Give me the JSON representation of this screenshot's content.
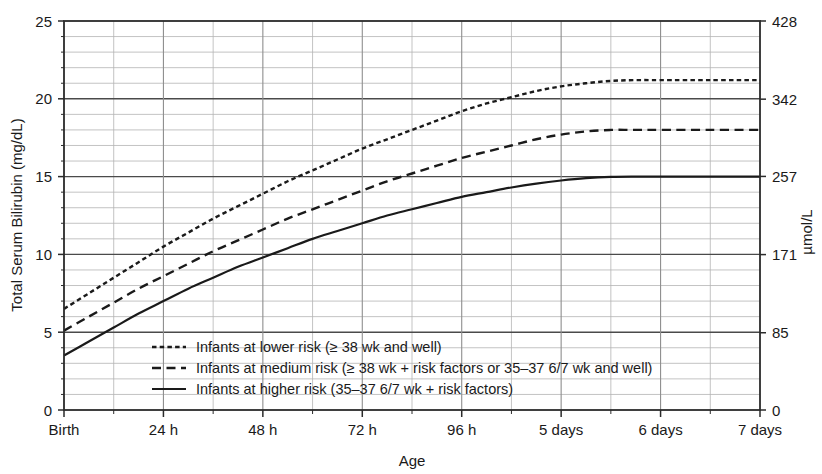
{
  "chart_data": {
    "type": "line",
    "title": "",
    "xlabel": "Age",
    "ylabel": "Total Serum Bilirubin (mg/dL)",
    "y2label": "µmol/L",
    "ylim": [
      0,
      25
    ],
    "y2lim": [
      0,
      428
    ],
    "grid": true,
    "legend_position": "bottom-left-inside",
    "x_tick_labels": [
      "Birth",
      "24 h",
      "48 h",
      "72 h",
      "96 h",
      "5 days",
      "6 days",
      "7 days"
    ],
    "x_tick_values": [
      0,
      1,
      2,
      3,
      4,
      5,
      6,
      7
    ],
    "x_minor_tick_interval_days": 0.5,
    "y_tick_labels": [
      "0",
      "5",
      "10",
      "15",
      "20",
      "25"
    ],
    "y_tick_values": [
      0,
      5,
      10,
      15,
      20,
      25
    ],
    "y_minor_tick_interval": 1,
    "y2_tick_labels": [
      "0",
      "85",
      "171",
      "257",
      "342",
      "428"
    ],
    "y2_tick_values": [
      0,
      85,
      171,
      257,
      342,
      428
    ],
    "xlim_days": [
      0,
      7
    ],
    "series": [
      {
        "name": "Infants at lower risk (≥ 38 wk and well)",
        "style": "dotted",
        "color": "#1a1a1a",
        "x": [
          0,
          0.25,
          0.5,
          0.75,
          1,
          1.25,
          1.5,
          1.75,
          2,
          2.25,
          2.5,
          2.75,
          3,
          3.25,
          3.5,
          3.75,
          4,
          4.25,
          4.5,
          4.75,
          5,
          5.25,
          5.5,
          5.75,
          6,
          6.5,
          7
        ],
        "values": [
          6.5,
          7.5,
          8.5,
          9.5,
          10.5,
          11.4,
          12.3,
          13.1,
          13.9,
          14.7,
          15.4,
          16.1,
          16.8,
          17.4,
          18.0,
          18.6,
          19.2,
          19.7,
          20.1,
          20.5,
          20.8,
          21.0,
          21.15,
          21.2,
          21.2,
          21.2,
          21.2
        ]
      },
      {
        "name": "Infants at medium risk (≥ 38 wk + risk factors or 35–37 6/7 wk and well)",
        "style": "dashed",
        "color": "#1a1a1a",
        "x": [
          0,
          0.25,
          0.5,
          0.75,
          1,
          1.25,
          1.5,
          1.75,
          2,
          2.25,
          2.5,
          2.75,
          3,
          3.25,
          3.5,
          3.75,
          4,
          4.25,
          4.5,
          4.75,
          5,
          5.25,
          5.5,
          5.75,
          6,
          6.5,
          7
        ],
        "values": [
          5.1,
          6.0,
          6.9,
          7.8,
          8.6,
          9.4,
          10.2,
          10.9,
          11.6,
          12.3,
          12.9,
          13.5,
          14.1,
          14.7,
          15.2,
          15.7,
          16.2,
          16.6,
          17.0,
          17.4,
          17.7,
          17.9,
          18.0,
          18.0,
          18.0,
          18.0,
          18.0
        ]
      },
      {
        "name": "Infants at higher risk (35–37 6/7 wk + risk factors)",
        "style": "solid",
        "color": "#1a1a1a",
        "x": [
          0,
          0.25,
          0.5,
          0.75,
          1,
          1.25,
          1.5,
          1.75,
          2,
          2.25,
          2.5,
          2.75,
          3,
          3.25,
          3.5,
          3.75,
          4,
          4.25,
          4.5,
          4.75,
          5,
          5.25,
          5.5,
          5.75,
          6,
          6.5,
          7
        ],
        "values": [
          3.5,
          4.4,
          5.3,
          6.2,
          7.0,
          7.8,
          8.5,
          9.2,
          9.8,
          10.4,
          11.0,
          11.5,
          12.0,
          12.5,
          12.9,
          13.3,
          13.7,
          14.0,
          14.3,
          14.55,
          14.75,
          14.9,
          14.98,
          15.0,
          15.0,
          15.0,
          15.0
        ]
      }
    ]
  },
  "legend": {
    "items": [
      {
        "label": "Infants at lower risk (≥ 38 wk and well)",
        "style": "dotted"
      },
      {
        "label": "Infants at medium risk (≥ 38 wk + risk factors or 35–37 6/7 wk and well)",
        "style": "dashed"
      },
      {
        "label": "Infants at higher risk (35–37 6/7 wk + risk factors)",
        "style": "solid"
      }
    ]
  },
  "colors": {
    "ink": "#1a1a1a",
    "frame": "#2b2b2b",
    "major_grid": "#4a4a4a",
    "minor_grid": "#b4b4b4",
    "background": "#ffffff"
  }
}
